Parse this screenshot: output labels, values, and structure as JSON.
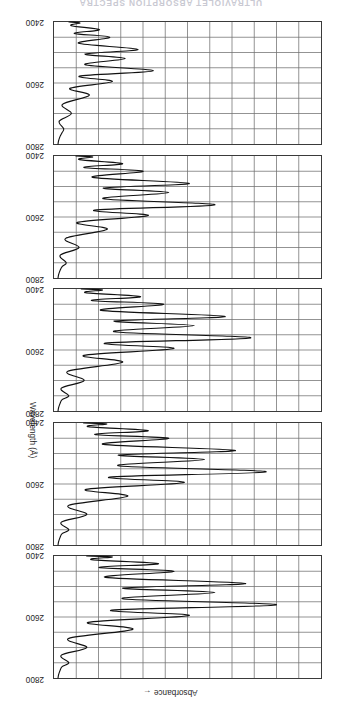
{
  "figure": {
    "running_head": "ULTRAVIOLET ABSORPTION SPECTRA",
    "orientation_note": "rotated-180",
    "x_axis_label": "Absorbance",
    "x_axis_arrow": "←",
    "y_axis_label": "Wavelength (Å)",
    "tick_labels": [
      "2400",
      "2600",
      "2800"
    ]
  },
  "chart_data": {
    "type": "line",
    "title": "ULTRAVIOLET ABSORPTION SPECTRA",
    "xlabel": "Absorbance",
    "ylabel": "Wavelength (Å)",
    "ylim": [
      2400,
      2800
    ],
    "yticks": [
      2400,
      2600,
      2800
    ],
    "grid": true,
    "grid_rows": 8,
    "grid_cols": 12,
    "legend": "none",
    "orientation": "wavelength on vertical axis, absorbance on horizontal axis increasing leftward",
    "panel_count": 5,
    "panels": [
      {
        "index": 1,
        "label": "",
        "peaks_wavelength": [
          2750,
          2700,
          2640,
          2595,
          2560,
          2520,
          2490,
          2450,
          2425
        ],
        "peaks_absorbance": [
          0.05,
          0.12,
          0.3,
          0.52,
          0.86,
          0.62,
          0.74,
          0.46,
          0.4
        ],
        "baseline_absorbance": 0.02,
        "description": "strongest vibrational fine structure; deepest peak near 2560 A"
      },
      {
        "index": 2,
        "label": "",
        "peaks_wavelength": [
          2750,
          2700,
          2640,
          2595,
          2560,
          2520,
          2490,
          2450,
          2425
        ],
        "peaks_absorbance": [
          0.05,
          0.12,
          0.28,
          0.5,
          0.82,
          0.58,
          0.7,
          0.44,
          0.36
        ],
        "baseline_absorbance": 0.02,
        "description": "very similar to panel 1, peaks marginally less intense"
      },
      {
        "index": 3,
        "label": "",
        "peaks_wavelength": [
          2750,
          2700,
          2640,
          2595,
          2560,
          2520,
          2490,
          2450,
          2425
        ],
        "peaks_absorbance": [
          0.05,
          0.11,
          0.26,
          0.46,
          0.76,
          0.54,
          0.66,
          0.42,
          0.33
        ],
        "baseline_absorbance": 0.02,
        "description": "middle panel, peaks slightly reduced"
      },
      {
        "index": 4,
        "label": "",
        "peaks_wavelength": [
          2750,
          2700,
          2640,
          2595,
          2560,
          2520,
          2490,
          2450,
          2425
        ],
        "peaks_absorbance": [
          0.04,
          0.09,
          0.2,
          0.36,
          0.62,
          0.44,
          0.52,
          0.34,
          0.26
        ],
        "baseline_absorbance": 0.02,
        "description": "reduced band intensity, narrower excursions"
      },
      {
        "index": 5,
        "label": "",
        "peaks_wavelength": [
          2750,
          2700,
          2640,
          2595,
          2560,
          2520,
          2490,
          2450,
          2425
        ],
        "peaks_absorbance": [
          0.03,
          0.06,
          0.13,
          0.22,
          0.38,
          0.27,
          0.32,
          0.21,
          0.17
        ],
        "baseline_absorbance": 0.02,
        "description": "weakest spectrum, shallow fine structure"
      }
    ]
  }
}
